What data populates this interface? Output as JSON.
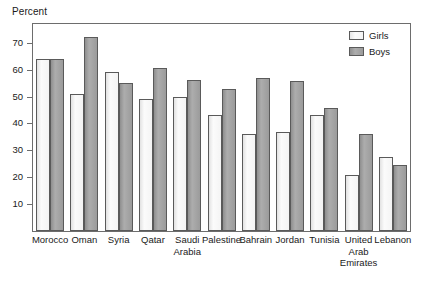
{
  "chart_data": {
    "type": "bar",
    "title": "",
    "subtitle": "",
    "xlabel": "",
    "ylabel": "Percent",
    "ylim": [
      0,
      77
    ],
    "yticks": [
      10,
      20,
      30,
      40,
      50,
      60,
      70
    ],
    "ytick_labels": [
      "10",
      "20",
      "30",
      "40",
      "50",
      "60",
      "70"
    ],
    "grid": false,
    "legend_position": "top-right",
    "categories": [
      "Morocco",
      "Oman",
      "Syria",
      "Qatar",
      "Saudi Arabia",
      "Palestine",
      "Bahrain",
      "Jordan",
      "Tunisia",
      "United Arab Emirates",
      "Lebanon"
    ],
    "category_label_lines": [
      [
        "Morocco"
      ],
      [
        "Oman"
      ],
      [
        "Syria"
      ],
      [
        "Qatar"
      ],
      [
        "Saudi",
        "Arabia"
      ],
      [
        "Palestine"
      ],
      [
        "Bahrain"
      ],
      [
        "Jordan"
      ],
      [
        "Tunisia"
      ],
      [
        "United",
        "Arab",
        "Emirates"
      ],
      [
        "Lebanon"
      ]
    ],
    "series": [
      {
        "name": "Girls",
        "color": "#f4f4f4",
        "values": [
          64,
          51,
          59,
          49.2,
          50,
          43,
          36,
          37,
          43,
          21,
          27.5
        ]
      },
      {
        "name": "Boys",
        "color": "#9b9b9b",
        "values": [
          64,
          72,
          55,
          60.5,
          56,
          53,
          57,
          55.8,
          45.7,
          36,
          24.5
        ]
      }
    ]
  },
  "legend": {
    "items": [
      {
        "label": "Girls",
        "swatch": "girls"
      },
      {
        "label": "Boys",
        "swatch": "boys"
      }
    ]
  },
  "axes": {
    "y_axis_title": "Percent"
  },
  "colors": {
    "frame": "#6d6d6d",
    "bar_outline": "#5a5a5a",
    "girls_fill": "#f4f4f4",
    "boys_fill": "#9b9b9b",
    "text": "#1a1a1a",
    "background": "#ffffff"
  }
}
